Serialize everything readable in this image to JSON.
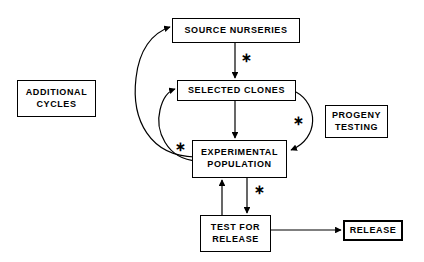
{
  "diagram": {
    "background_color": "#ffffff",
    "line_color": "#000000",
    "nodes": [
      {
        "id": "source-nurseries",
        "label": "SOURCE NURSERIES",
        "x": 172,
        "y": 18,
        "w": 128,
        "h": 25,
        "thick": false
      },
      {
        "id": "selected-clones",
        "label": "SELECTED CLONES",
        "x": 177,
        "y": 80,
        "w": 119,
        "h": 21,
        "thick": false
      },
      {
        "id": "experimental-population",
        "label": "EXPERIMENTAL\nPOPULATION",
        "x": 192,
        "y": 140,
        "w": 95,
        "h": 38,
        "thick": false
      },
      {
        "id": "test-for-release",
        "label": "TEST FOR\nRELEASE",
        "x": 200,
        "y": 215,
        "w": 71,
        "h": 37,
        "thick": false
      },
      {
        "id": "release",
        "label": "RELEASE",
        "x": 343,
        "y": 220,
        "w": 60,
        "h": 21,
        "thick": true
      },
      {
        "id": "additional-cycles",
        "label": "ADDITIONAL\nCYCLES",
        "x": 17,
        "y": 80,
        "w": 79,
        "h": 37,
        "thick": false
      },
      {
        "id": "progeny-testing",
        "label": "PROGENY\nTESTING",
        "x": 325,
        "y": 105,
        "w": 63,
        "h": 33,
        "thick": false
      }
    ],
    "markers": [
      {
        "id": "asterisk-source-to-clones",
        "glyph": "∗",
        "x": 241,
        "y": 51
      },
      {
        "id": "asterisk-clones-to-population",
        "glyph": "∗",
        "x": 293,
        "y": 114
      },
      {
        "id": "asterisk-population-feedback",
        "glyph": "∗",
        "x": 175,
        "y": 140
      },
      {
        "id": "asterisk-population-to-test",
        "glyph": "∗",
        "x": 254,
        "y": 183
      }
    ],
    "edges": [
      {
        "id": "edge-source-to-clones",
        "from": "source-nurseries",
        "to": "selected-clones",
        "style": "straight",
        "marked": true
      },
      {
        "id": "edge-clones-to-population",
        "from": "selected-clones",
        "to": "experimental-population",
        "style": "straight",
        "marked": false
      },
      {
        "id": "edge-clones-curve-to-population",
        "from": "selected-clones",
        "to": "experimental-population",
        "style": "curved-right",
        "marked": true
      },
      {
        "id": "edge-population-to-source",
        "from": "experimental-population",
        "to": "source-nurseries",
        "style": "curved-left-outer",
        "marked": true
      },
      {
        "id": "edge-population-to-clones",
        "from": "experimental-population",
        "to": "selected-clones",
        "style": "curved-left-inner",
        "marked": true
      },
      {
        "id": "edge-population-to-test",
        "from": "experimental-population",
        "to": "test-for-release",
        "style": "straight",
        "marked": true
      },
      {
        "id": "edge-test-to-population",
        "from": "test-for-release",
        "to": "experimental-population",
        "style": "straight",
        "marked": false
      },
      {
        "id": "edge-test-to-release",
        "from": "test-for-release",
        "to": "release",
        "style": "straight",
        "marked": false
      }
    ]
  }
}
